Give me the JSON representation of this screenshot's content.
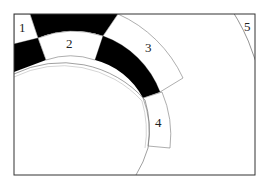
{
  "diagram": {
    "type": "concentric-segmented-rings",
    "labels": [
      "1",
      "2",
      "3",
      "4",
      "5"
    ],
    "colors": {
      "dark": "#000000",
      "light": "#ffffff",
      "stroke": "#555555",
      "frame": "#333333"
    }
  }
}
